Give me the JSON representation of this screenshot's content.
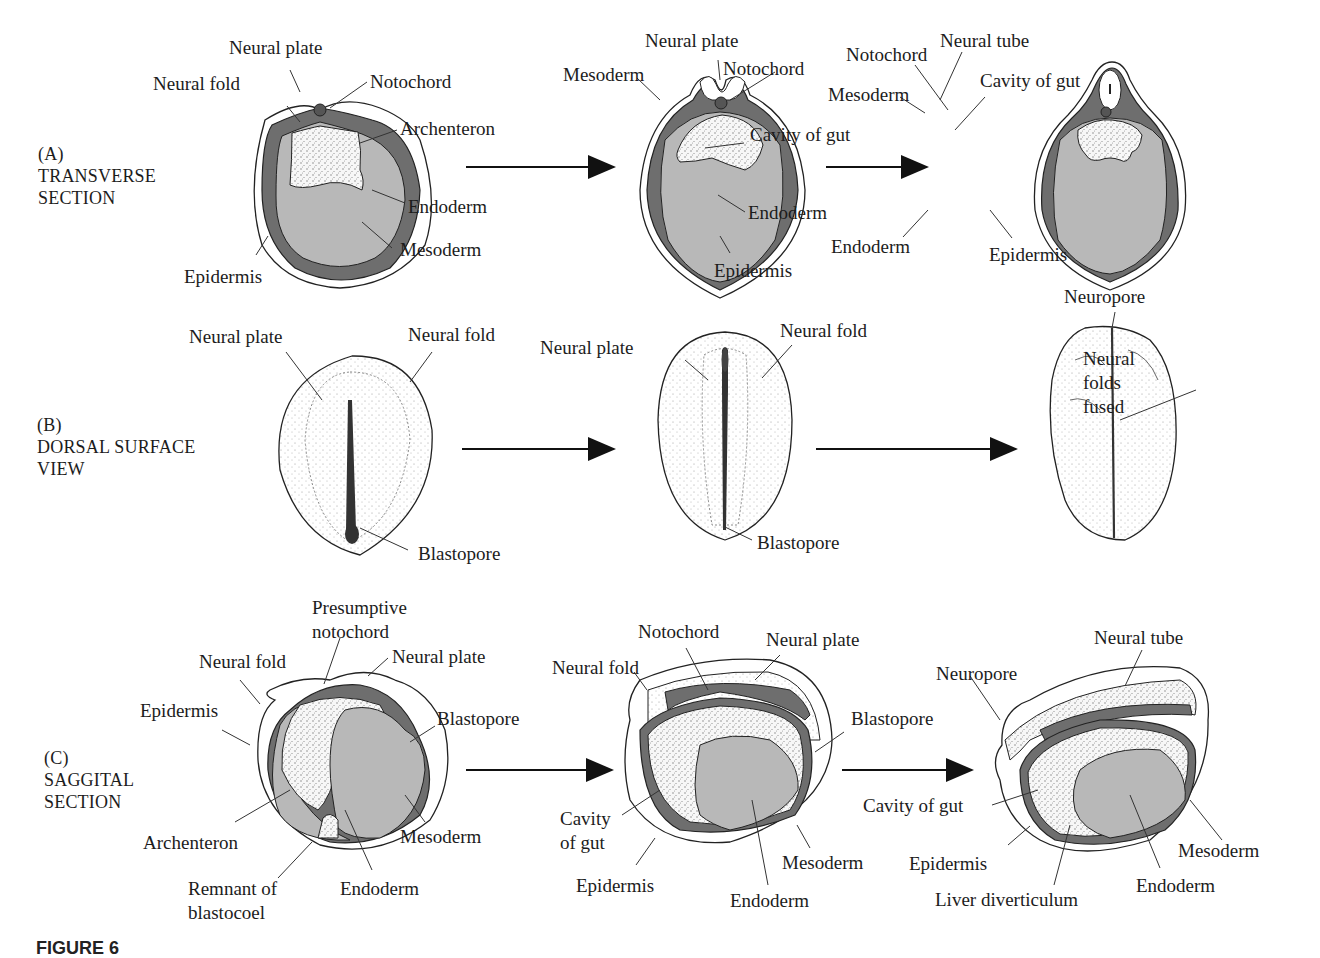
{
  "figure": {
    "caption_partial": "FIGURE 6",
    "colors": {
      "mesoderm": "#6e6e6e",
      "endoderm": "#b8b8b8",
      "epidermis": "#ffffff",
      "stipple": "#f2f2f2",
      "outline": "#222222"
    },
    "rows": [
      {
        "id": "A",
        "tag": "(A)",
        "title_line1": "TRANSVERSE",
        "title_line2": "SECTION",
        "stages": [
          {
            "labels": [
              "Neural plate",
              "Neural fold",
              "Notochord",
              "Archenteron",
              "Endoderm",
              "Mesoderm",
              "Epidermis"
            ]
          },
          {
            "labels": [
              "Neural plate",
              "Mesoderm",
              "Notochord",
              "Cavity of gut",
              "Endoderm",
              "Epidermis"
            ]
          },
          {
            "labels": [
              "Notochord",
              "Neural tube",
              "Mesoderm",
              "Cavity of gut",
              "Endoderm",
              "Epidermis"
            ]
          }
        ]
      },
      {
        "id": "B",
        "tag": "(B)",
        "title_line1": "DORSAL SURFACE",
        "title_line2": "VIEW",
        "stages": [
          {
            "labels": [
              "Neural plate",
              "Neural fold",
              "Blastopore"
            ]
          },
          {
            "labels": [
              "Neural plate",
              "Neural fold",
              "Blastopore"
            ]
          },
          {
            "labels": [
              "Neuropore",
              "Neural",
              "folds",
              "fused"
            ]
          }
        ]
      },
      {
        "id": "C",
        "tag": "(C)",
        "title_line1": "SAGGITAL",
        "title_line2": "SECTION",
        "stages": [
          {
            "labels": [
              "Presumptive",
              "notochord",
              "Neural fold",
              "Neural plate",
              "Epidermis",
              "Blastopore",
              "Archenteron",
              "Mesoderm",
              "Remnant of",
              "blastocoel",
              "Endoderm"
            ]
          },
          {
            "labels": [
              "Notochord",
              "Neural plate",
              "Neural fold",
              "Blastopore",
              "Cavity",
              "of gut",
              "Epidermis",
              "Mesoderm",
              "Endoderm"
            ]
          },
          {
            "labels": [
              "Neural tube",
              "Neuropore",
              "Cavity of gut",
              "Epidermis",
              "Mesoderm",
              "Liver diverticulum",
              "Endoderm"
            ]
          }
        ]
      }
    ]
  }
}
